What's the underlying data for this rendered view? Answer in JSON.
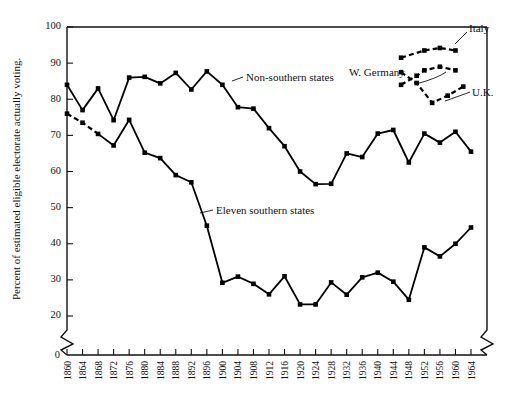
{
  "chart_data": {
    "type": "line",
    "title": "",
    "xlabel": "",
    "ylabel": "Percent of estimated eligible electorate actually voting.",
    "ylim": [
      20,
      100
    ],
    "yticks": [
      20,
      30,
      40,
      50,
      60,
      70,
      80,
      90,
      100
    ],
    "y_axis_break": true,
    "y_break_label": "0",
    "xlim": [
      1860,
      1964
    ],
    "grid": false,
    "legend_position": "inline-annotations",
    "xticks": [
      1860,
      1864,
      1868,
      1872,
      1876,
      1880,
      1884,
      1888,
      1892,
      1896,
      1900,
      1904,
      1908,
      1912,
      1916,
      1920,
      1924,
      1928,
      1932,
      1936,
      1940,
      1944,
      1948,
      1952,
      1956,
      1960,
      1964
    ],
    "x": [
      1860,
      1864,
      1868,
      1872,
      1876,
      1880,
      1884,
      1888,
      1892,
      1896,
      1900,
      1904,
      1908,
      1912,
      1916,
      1920,
      1924,
      1928,
      1932,
      1936,
      1940,
      1944,
      1948,
      1952,
      1956,
      1960,
      1964
    ],
    "series": [
      {
        "name": "Non-southern states",
        "style": "solid",
        "marker": "filled-square",
        "values": [
          84.0,
          77.0,
          83.0,
          74.2,
          86.0,
          86.2,
          84.4,
          87.3,
          82.7,
          87.7,
          84.0,
          77.8,
          77.4,
          72.0,
          67.0,
          60.0,
          56.5,
          56.6,
          65.0,
          64.0,
          70.5,
          71.5,
          62.5,
          70.5,
          68.0,
          71.0,
          65.5
        ]
      },
      {
        "name": "Eleven southern states",
        "style": "solid-with-dashed-lead",
        "dashed_segments": [
          [
            1860,
            1864
          ],
          [
            1864,
            1868
          ]
        ],
        "marker": "filled-square",
        "values": [
          76.0,
          73.5,
          70.4,
          67.2,
          74.3,
          65.2,
          63.7,
          59.0,
          57.0,
          45.0,
          29.2,
          30.9,
          28.9,
          26.0,
          31.0,
          23.2,
          23.2,
          29.3,
          25.9,
          30.7,
          32.0,
          29.5,
          24.5,
          39.0,
          36.5,
          40.0,
          44.5
        ]
      },
      {
        "name": "Italy",
        "style": "dashed",
        "marker": "filled-square",
        "x": [
          1946,
          1952,
          1956,
          1960
        ],
        "values": [
          91.5,
          93.5,
          94.2,
          93.5
        ],
        "note": "inset comparison series, upper right"
      },
      {
        "name": "W. Germany",
        "style": "dashed",
        "marker": "filled-square",
        "x": [
          1946,
          1950,
          1952,
          1956,
          1960
        ],
        "values": [
          84.0,
          86.5,
          88.0,
          89.0,
          88.0
        ],
        "note": "inset comparison series, upper right"
      },
      {
        "name": "U.K.",
        "style": "dashed",
        "marker": "filled-square",
        "x": [
          1946,
          1950,
          1954,
          1958,
          1962
        ],
        "values": [
          87.5,
          84.5,
          79.0,
          81.0,
          83.5
        ],
        "note": "inset comparison series, upper right"
      }
    ],
    "annotations": [
      {
        "text": "Non-southern states",
        "x": 1896,
        "y": 85
      },
      {
        "text": "Eleven southern states",
        "x": 1900,
        "y": 51
      },
      {
        "text": "Italy",
        "x": 1960,
        "y": 96
      },
      {
        "text": "W. Germany",
        "x": 1928,
        "y": 86
      },
      {
        "text": "U.K.",
        "x": 1958,
        "y": 83
      }
    ]
  },
  "axis": {
    "y_title": "Percent of estimated eligible electorate actually voting.",
    "y_zero_label": "0",
    "y_ticks": [
      "100",
      "90",
      "80",
      "70",
      "60",
      "50",
      "40",
      "30",
      "20"
    ],
    "x_ticks": [
      "1860",
      "1864",
      "1868",
      "1872",
      "1876",
      "1880",
      "1884",
      "1888",
      "1892",
      "1896",
      "1900",
      "1904",
      "1908",
      "1912",
      "1916",
      "1920",
      "1924",
      "1928",
      "1932",
      "1936",
      "1940",
      "1944",
      "1948",
      "1952",
      "1956",
      "1960",
      "1964"
    ]
  },
  "labels": {
    "non_southern": "Non-southern states",
    "eleven_southern": "Eleven southern states",
    "italy": "Italy",
    "w_germany": "W. Germany",
    "uk": "U.K."
  },
  "colors": {
    "ink": "#111111",
    "background": "#ffffff"
  }
}
